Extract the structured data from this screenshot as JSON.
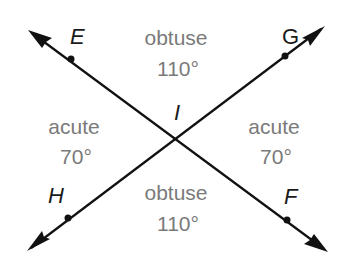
{
  "diagram": {
    "type": "intersecting-lines",
    "intersection_point": "I",
    "lines": [
      {
        "name": "line-EF",
        "from": "E",
        "to": "F"
      },
      {
        "name": "line-HG",
        "from": "H",
        "to": "G"
      }
    ],
    "points": {
      "E": "E",
      "G": "G",
      "H": "H",
      "F": "F",
      "I": "I"
    },
    "angles": {
      "top": {
        "type": "obtuse",
        "measure": "110°"
      },
      "bottom": {
        "type": "obtuse",
        "measure": "110°"
      },
      "left": {
        "type": "acute",
        "measure": "70°"
      },
      "right": {
        "type": "acute",
        "measure": "70°"
      }
    },
    "colors": {
      "line": "#111111",
      "angle_text": "#7a7a7a",
      "label_text": "#1a1a1a"
    }
  }
}
